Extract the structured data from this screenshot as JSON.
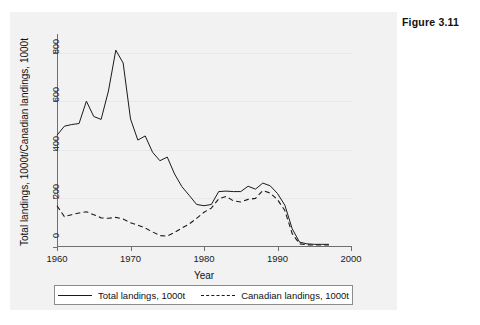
{
  "top_artifact": "                                                                                ",
  "figure": {
    "label": "Figure 3.11"
  },
  "chart_data": {
    "type": "line",
    "title": "",
    "xlabel": "Year",
    "ylabel": "Total landings, 1000t/Canadian landings, 1000t",
    "xlim": [
      1960,
      2000
    ],
    "ylim": [
      0,
      860
    ],
    "xticks": [
      1960,
      1970,
      1980,
      1990,
      2000
    ],
    "yticks": [
      0,
      200,
      400,
      600,
      800
    ],
    "grid": "horizontal",
    "legend_position": "below-axes",
    "x": [
      1960,
      1961,
      1962,
      1963,
      1964,
      1965,
      1966,
      1967,
      1968,
      1969,
      1970,
      1971,
      1972,
      1973,
      1974,
      1975,
      1976,
      1977,
      1978,
      1979,
      1980,
      1981,
      1982,
      1983,
      1984,
      1985,
      1986,
      1987,
      1988,
      1989,
      1990,
      1991,
      1992,
      1993,
      1994,
      1995,
      1996,
      1997
    ],
    "series": [
      {
        "name": "Total landings, 1000t",
        "style": "solid",
        "values": [
          460,
          497,
          504,
          508,
          600,
          537,
          525,
          642,
          810,
          757,
          527,
          440,
          457,
          390,
          355,
          370,
          300,
          248,
          212,
          175,
          170,
          175,
          228,
          230,
          228,
          228,
          250,
          238,
          263,
          252,
          220,
          172,
          75,
          20,
          13,
          11,
          11,
          11
        ]
      },
      {
        "name": "Canadian landings, 1000t",
        "style": "dashed",
        "values": [
          170,
          125,
          133,
          140,
          145,
          133,
          120,
          118,
          122,
          115,
          100,
          90,
          78,
          62,
          47,
          45,
          60,
          78,
          95,
          118,
          143,
          160,
          198,
          208,
          190,
          185,
          196,
          200,
          232,
          222,
          195,
          150,
          55,
          13,
          9,
          8,
          8,
          8
        ]
      }
    ]
  },
  "legend": {
    "entries": [
      {
        "label": "Total landings, 1000t",
        "style": "solid"
      },
      {
        "label": "Canadian landings, 1000t",
        "style": "dashed"
      }
    ]
  },
  "colors": {
    "line": "#1a1a1a",
    "axis": "#6f6f6f",
    "grid": "#e9e9e9",
    "panel": "#f2f2f2",
    "plot_background": "#ffffff"
  }
}
